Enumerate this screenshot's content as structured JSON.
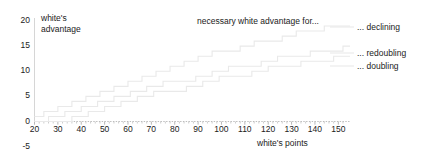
{
  "chart_data": {
    "type": "line",
    "title": "necessary white advantage for...",
    "xlabel": "white's points",
    "ylabel": "white's advantage",
    "xlim": [
      20,
      155
    ],
    "ylim": [
      -5,
      21
    ],
    "xticks": [
      20,
      30,
      40,
      50,
      60,
      70,
      80,
      90,
      100,
      110,
      120,
      130,
      140,
      150
    ],
    "yticks": [
      -5,
      0,
      5,
      10,
      15,
      20
    ],
    "grid": false,
    "legend_position": "right",
    "line_color": "#e9e9e9",
    "axis_color": "#d2d2d2",
    "text_color": "#1b1b1b",
    "series": [
      {
        "name": "... declining",
        "label": "... declining",
        "step_x": [
          20,
          24,
          30,
          36,
          42,
          48,
          54,
          60,
          66,
          72,
          78,
          84,
          90,
          96,
          102,
          108,
          114,
          120,
          126,
          132,
          138,
          144,
          150,
          155
        ],
        "step_y": [
          1,
          2,
          3,
          4,
          5,
          6,
          7,
          8,
          9,
          10,
          11,
          12,
          13,
          14,
          14,
          15,
          16,
          16,
          17,
          18,
          18,
          19,
          19,
          19
        ]
      },
      {
        "name": "... redoubling",
        "label": "... redoubling",
        "step_x": [
          20,
          26,
          33,
          40,
          47,
          54,
          61,
          68,
          75,
          82,
          89,
          96,
          103,
          110,
          117,
          124,
          131,
          138,
          145,
          152,
          155
        ],
        "step_y": [
          0,
          1,
          2,
          3,
          4,
          5,
          6,
          7,
          8,
          8,
          9,
          10,
          11,
          11,
          12,
          13,
          13,
          14,
          14,
          15,
          15
        ]
      },
      {
        "name": "... doubling",
        "label": "... doubling",
        "step_x": [
          20,
          29,
          36,
          43,
          50,
          57,
          64,
          71,
          78,
          85,
          92,
          99,
          106,
          113,
          120,
          127,
          134,
          141,
          148,
          155
        ],
        "step_y": [
          0,
          0,
          1,
          2,
          3,
          4,
          5,
          6,
          6,
          7,
          8,
          9,
          9,
          10,
          11,
          11,
          12,
          12,
          13,
          13
        ]
      }
    ]
  },
  "axis": {
    "y_label_line1": "white's",
    "y_label_line2": "advantage",
    "x_label": "white's points"
  },
  "ytick_labels": [
    "20",
    "15",
    "10",
    "5",
    "0",
    "-5"
  ],
  "xtick_labels": [
    "20",
    "30",
    "40",
    "50",
    "60",
    "70",
    "80",
    "90",
    "100",
    "110",
    "120",
    "130",
    "140",
    "150"
  ],
  "annotation": {
    "title": "necessary white advantage for..."
  },
  "legend": {
    "items": [
      {
        "label": "... declining"
      },
      {
        "label": "... redoubling"
      },
      {
        "label": "... doubling"
      }
    ]
  }
}
